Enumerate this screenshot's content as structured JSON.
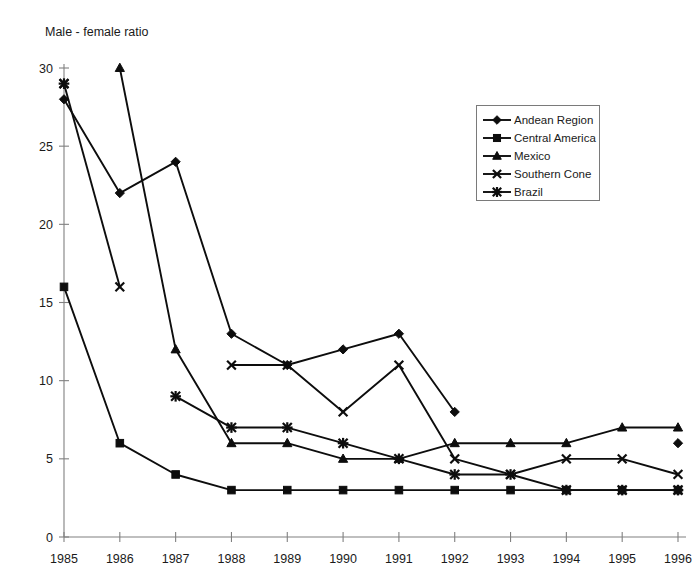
{
  "chart_data": {
    "type": "line",
    "title": "",
    "ylabel": "Male - female ratio",
    "xlabel": "",
    "categories": [
      "1985",
      "1986",
      "1987",
      "1988",
      "1989",
      "1990",
      "1991",
      "1992",
      "1993",
      "1994",
      "1995",
      "1996"
    ],
    "ylim": [
      0,
      30
    ],
    "yticks": [
      0,
      5,
      10,
      15,
      20,
      25,
      30
    ],
    "grid": false,
    "legend_position": "top-right",
    "series": [
      {
        "name": "Andean Region",
        "marker": "diamond",
        "values": [
          28,
          22,
          24,
          13,
          11,
          12,
          13,
          8,
          null,
          null,
          null,
          6
        ]
      },
      {
        "name": "Central America",
        "marker": "square",
        "values": [
          16,
          6,
          4,
          3,
          3,
          3,
          3,
          3,
          3,
          3,
          3,
          3
        ]
      },
      {
        "name": "Mexico",
        "marker": "triangle",
        "values": [
          null,
          30,
          12,
          6,
          6,
          5,
          5,
          6,
          6,
          6,
          7,
          7
        ]
      },
      {
        "name": "Southern Cone",
        "marker": "x",
        "values": [
          29,
          16,
          null,
          11,
          11,
          8,
          11,
          5,
          4,
          5,
          5,
          4
        ]
      },
      {
        "name": "Brazil",
        "marker": "asterisk",
        "values": [
          29,
          null,
          9,
          7,
          7,
          6,
          5,
          4,
          4,
          3,
          3,
          3
        ]
      }
    ]
  },
  "ytick_labels": [
    "0",
    "5",
    "10",
    "15",
    "20",
    "25",
    "30"
  ],
  "legend": {
    "items": [
      {
        "label": "Andean Region",
        "marker": "diamond"
      },
      {
        "label": "Central America",
        "marker": "square"
      },
      {
        "label": "Mexico",
        "marker": "triangle"
      },
      {
        "label": "Southern Cone",
        "marker": "x"
      },
      {
        "label": "Brazil",
        "marker": "asterisk"
      }
    ]
  }
}
